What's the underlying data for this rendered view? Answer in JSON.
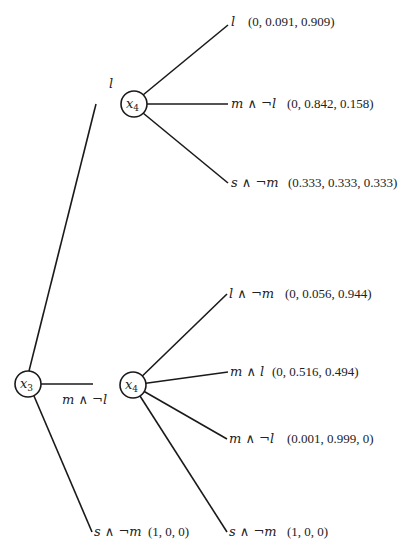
{
  "diagram": {
    "type": "decision-tree",
    "root": {
      "id": "x3_root",
      "var": "x",
      "sub": "3",
      "cx": 28,
      "cy": 384,
      "r": 13
    },
    "nodes": [
      {
        "id": "x4_top",
        "var": "x",
        "sub": "4",
        "cx": 134,
        "cy": 104,
        "r": 13
      },
      {
        "id": "x4_bottom",
        "var": "x",
        "sub": "4",
        "cx": 133,
        "cy": 385,
        "r": 13
      }
    ],
    "root_edges": [
      {
        "from": "x3_root",
        "to": "x4_top",
        "x1": 29,
        "y1": 371,
        "x2": 96,
        "y2": 104,
        "label": "l",
        "label_x": 109,
        "label_y": 88
      },
      {
        "from": "x3_root",
        "to": "x4_bottom",
        "x1": 41,
        "y1": 384,
        "x2": 93,
        "y2": 384,
        "label": "m ∧ ¬l",
        "label_x": 62,
        "label_y": 404
      },
      {
        "from": "x3_root",
        "to": "leaf",
        "x1": 34,
        "y1": 396,
        "x2": 92,
        "y2": 532,
        "label": "s ∧ ¬m",
        "tuple": "(1, 0, 0)",
        "label_x": 94,
        "tuple_x": 148,
        "label_y": 536
      }
    ],
    "top_branches": [
      {
        "x2": 228,
        "y2": 25,
        "label": "l",
        "tuple": "(0, 0.091, 0.909)",
        "label_x": 231,
        "tuple_x": 248,
        "label_y": 26
      },
      {
        "x2": 228,
        "y2": 104,
        "label": "m ∧ ¬l",
        "tuple": "(0, 0.842, 0.158)",
        "label_x": 231,
        "tuple_x": 287,
        "label_y": 108
      },
      {
        "x2": 228,
        "y2": 183,
        "label": "s ∧ ¬m",
        "tuple": "(0.333, 0.333, 0.333)",
        "label_x": 231,
        "tuple_x": 288,
        "label_y": 187
      }
    ],
    "bottom_branches": [
      {
        "x2": 227,
        "y2": 294,
        "label": "l ∧ ¬m",
        "tuple": "(0, 0.056, 0.944)",
        "label_x": 229,
        "tuple_x": 285,
        "label_y": 298
      },
      {
        "x2": 228,
        "y2": 372,
        "label": "m ∧ l",
        "tuple": "(0, 0.516, 0.494)",
        "label_x": 230,
        "tuple_x": 272,
        "label_y": 376
      },
      {
        "x2": 227,
        "y2": 439,
        "label": "m ∧ ¬l",
        "tuple": "(0.001, 0.999, 0)",
        "label_x": 229,
        "tuple_x": 287,
        "label_y": 443
      },
      {
        "x2": 227,
        "y2": 532,
        "label": "s ∧ ¬m",
        "tuple": "(1, 0, 0)",
        "label_x": 229,
        "tuple_x": 287,
        "label_y": 536
      }
    ]
  }
}
